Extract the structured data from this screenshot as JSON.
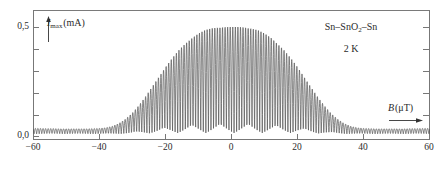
{
  "chart_data": {
    "type": "line",
    "title": "",
    "subtitle": "",
    "xlabel": "B (μT)",
    "xlabel_symbol": "B",
    "xlabel_unit": "(μT)",
    "ylabel": "I_max (mA)",
    "ylabel_symbol": "I",
    "ylabel_sub": "max",
    "ylabel_unit": "(mA)",
    "xlim": [
      -60,
      60
    ],
    "ylim": [
      0.0,
      0.55
    ],
    "xticks": [
      -60,
      -40,
      -20,
      0,
      20,
      40,
      60
    ],
    "xtick_labels": [
      "−60",
      "−40",
      "−20",
      "0",
      "20",
      "40",
      "60"
    ],
    "yticks": [
      0.0,
      0.1,
      0.2,
      0.3,
      0.4,
      0.5
    ],
    "ytick_labels": [
      "0,0",
      "",
      "",
      "",
      "",
      "0,5"
    ],
    "ytick_labels_shown": [
      "0,0",
      "0,5"
    ],
    "grid": false,
    "legend": false,
    "legend_position": "none",
    "line_color": "#555555",
    "frame_color": "#777777",
    "envelope_peak_value": 0.5,
    "envelope_peak_x": 0,
    "oscillation_period_uT": 1.55,
    "baseline_value": 0.01,
    "annotations": [
      {
        "text": "Sn–SnO₂–Sn",
        "x": 30,
        "y": 0.45
      },
      {
        "text": "2 K",
        "x": 30,
        "y": 0.37
      }
    ],
    "series": [
      {
        "name": "I_max vs B",
        "comment": "Envelope amplitude sampled every 2 uT from -60 to 60; fast oscillation rides on top with period ~1.55 uT",
        "x": [
          -60,
          -58,
          -56,
          -54,
          -52,
          -50,
          -48,
          -46,
          -44,
          -42,
          -40,
          -38,
          -36,
          -34,
          -32,
          -30,
          -28,
          -26,
          -24,
          -22,
          -20,
          -18,
          -16,
          -14,
          -12,
          -10,
          -8,
          -6,
          -4,
          -2,
          0,
          2,
          4,
          6,
          8,
          10,
          12,
          14,
          16,
          18,
          20,
          22,
          24,
          26,
          28,
          30,
          32,
          34,
          36,
          38,
          40,
          42,
          44,
          46,
          48,
          50,
          52,
          54,
          56,
          58,
          60
        ],
        "envelope": [
          0.035,
          0.035,
          0.034,
          0.034,
          0.033,
          0.033,
          0.033,
          0.033,
          0.033,
          0.034,
          0.035,
          0.038,
          0.045,
          0.058,
          0.078,
          0.105,
          0.14,
          0.18,
          0.225,
          0.27,
          0.315,
          0.355,
          0.392,
          0.423,
          0.45,
          0.47,
          0.485,
          0.494,
          0.499,
          0.5,
          0.5,
          0.5,
          0.499,
          0.494,
          0.485,
          0.47,
          0.45,
          0.423,
          0.392,
          0.355,
          0.315,
          0.27,
          0.225,
          0.18,
          0.14,
          0.105,
          0.078,
          0.058,
          0.045,
          0.038,
          0.035,
          0.034,
          0.033,
          0.033,
          0.033,
          0.033,
          0.033,
          0.034,
          0.034,
          0.035,
          0.035
        ],
        "baseline": [
          0.01,
          0.01,
          0.01,
          0.01,
          0.01,
          0.01,
          0.01,
          0.01,
          0.01,
          0.01,
          0.01,
          0.01,
          0.01,
          0.01,
          0.011,
          0.011,
          0.012,
          0.012,
          0.013,
          0.013,
          0.014,
          0.014,
          0.014,
          0.014,
          0.014,
          0.014,
          0.014,
          0.014,
          0.014,
          0.014,
          0.014,
          0.014,
          0.014,
          0.014,
          0.014,
          0.014,
          0.014,
          0.014,
          0.014,
          0.014,
          0.014,
          0.013,
          0.013,
          0.012,
          0.012,
          0.011,
          0.011,
          0.01,
          0.01,
          0.01,
          0.01,
          0.01,
          0.01,
          0.01,
          0.01,
          0.01,
          0.01,
          0.01,
          0.01,
          0.01,
          0.01
        ]
      }
    ]
  },
  "axes": {
    "y_axis_title_symbol": "I",
    "y_axis_title_sub": "max",
    "y_axis_title_unit": "(mA)",
    "x_axis_title_symbol": "B",
    "x_axis_title_unit": "(μT)"
  },
  "annotations": {
    "sample_prefix": "Sn–SnO",
    "sample_sub": "2",
    "sample_suffix": "–Sn",
    "sample_full": "Sn–SnO₂–Sn",
    "temperature": "2 K"
  },
  "ytick_text": {
    "top": "0,5",
    "bottom": "0,0"
  },
  "xtick_text": {
    "t0": "−60",
    "t1": "−40",
    "t2": "−20",
    "t3": "0",
    "t4": "20",
    "t5": "40",
    "t6": "60"
  },
  "colors": {
    "line": "#555555",
    "frame": "#777777",
    "text": "#2b2b2b",
    "background": "#ffffff"
  }
}
